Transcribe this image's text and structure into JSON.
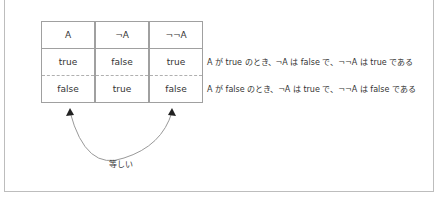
{
  "table": {
    "headers": [
      "A",
      "¬A",
      "¬¬A"
    ],
    "rows": [
      [
        "true",
        "false",
        "true"
      ],
      [
        "false",
        "true",
        "false"
      ]
    ]
  },
  "explanations": [
    "A が true のとき、¬A は false で、¬¬A は true である",
    "A が false のとき、¬A は true で、¬¬A は false である"
  ],
  "arrow_label": "等しい"
}
